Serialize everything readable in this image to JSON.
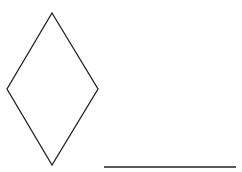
{
  "canvas": {
    "width": 242,
    "height": 172,
    "background": "#ffffff"
  },
  "shapes": {
    "diamond": {
      "type": "rhombus",
      "stroke": "#222222",
      "stroke_width": 1.3,
      "fill": "none",
      "points": [
        [
          52,
          13
        ],
        [
          98,
          89
        ],
        [
          52,
          165
        ],
        [
          7,
          89
        ]
      ]
    },
    "segment": {
      "type": "line",
      "stroke": "#222222",
      "stroke_width": 1.4,
      "x1": 104,
      "y1": 167,
      "x2": 236,
      "y2": 167
    }
  }
}
